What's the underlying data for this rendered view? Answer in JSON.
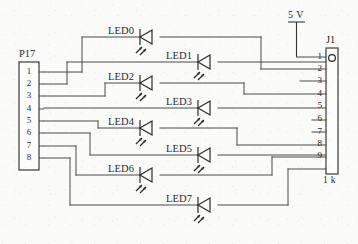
{
  "diagram": {
    "background_color": "#fbfbf9",
    "line_color": "#4a4a4a"
  },
  "connectors": [
    {
      "ref": "P17",
      "ref_label": "P17",
      "pin_count": 8,
      "pins": [
        "1",
        "2",
        "3",
        "4",
        "5",
        "6",
        "7",
        "8"
      ],
      "side": "left"
    },
    {
      "ref": "J1",
      "ref_label": "J1",
      "pin_count": 9,
      "pins": [
        "1",
        "2",
        "3",
        "4",
        "5",
        "6",
        "7",
        "8",
        "9"
      ],
      "side": "right",
      "value_label": "1 k",
      "has_pin1_marker": true
    }
  ],
  "supply": {
    "label": "5 V",
    "symbol": "power-rail",
    "connects_to": "J1 pin 1"
  },
  "leds": [
    {
      "ref": "LED0",
      "row": 0,
      "column": "even",
      "anode_net": "J1-2",
      "cathode_net": "P17-1"
    },
    {
      "ref": "LED1",
      "row": 1,
      "column": "odd",
      "anode_net": "J1-3",
      "cathode_net": "P17-2"
    },
    {
      "ref": "LED2",
      "row": 2,
      "column": "even",
      "anode_net": "J1-4",
      "cathode_net": "P17-3"
    },
    {
      "ref": "LED3",
      "row": 3,
      "column": "odd",
      "anode_net": "J1-5",
      "cathode_net": "P17-4"
    },
    {
      "ref": "LED4",
      "row": 4,
      "column": "even",
      "anode_net": "J1-6",
      "cathode_net": "P17-5"
    },
    {
      "ref": "LED5",
      "row": 5,
      "column": "odd",
      "anode_net": "J1-7",
      "cathode_net": "P17-6"
    },
    {
      "ref": "LED6",
      "row": 6,
      "column": "even",
      "anode_net": "J1-8",
      "cathode_net": "P17-7"
    },
    {
      "ref": "LED7",
      "row": 7,
      "column": "odd",
      "anode_net": "J1-9",
      "cathode_net": "P17-8"
    }
  ],
  "icons": {
    "led_symbol": "led-diode-icon",
    "emission_rays": "light-emission-icon",
    "power_rail": "power-rail-icon",
    "pin1_marker": "pin1-circle-icon"
  }
}
